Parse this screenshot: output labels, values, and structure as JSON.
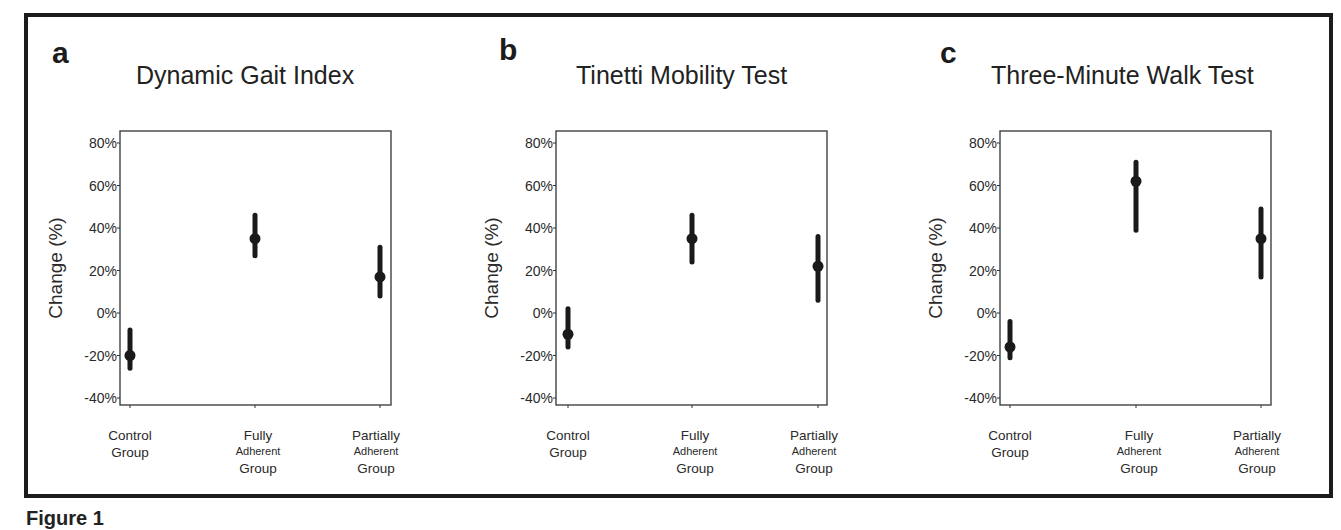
{
  "figure_caption": "Figure 1",
  "y_axis_label": "Change (%)",
  "y_ticks": [
    "80%",
    "60%",
    "40%",
    "20%",
    "0%",
    "-20%",
    "-40%"
  ],
  "categories": [
    {
      "line1": "Control",
      "line2": "Group",
      "line3": ""
    },
    {
      "line1": "Fully",
      "line2": "Adherent",
      "line3": "Group"
    },
    {
      "line1": "Partially",
      "line2": "Adherent",
      "line3": "Group"
    }
  ],
  "panels": [
    {
      "letter": "a",
      "title": "Dynamic Gait Index"
    },
    {
      "letter": "b",
      "title": "Tinetti Mobility Test"
    },
    {
      "letter": "c",
      "title": "Three-Minute Walk Test"
    }
  ],
  "chart_data": [
    {
      "type": "scatter",
      "subtype": "point-with-error-bars",
      "panel": "a",
      "title": "Dynamic Gait Index",
      "xlabel": "",
      "ylabel": "Change (%)",
      "categories": [
        "Control Group",
        "Fully Adherent Group",
        "Partially Adherent Group"
      ],
      "values": [
        -20,
        35,
        17
      ],
      "lower": [
        -26,
        27,
        8
      ],
      "upper": [
        -8,
        46,
        31
      ],
      "yticks": [
        -40,
        -20,
        0,
        20,
        40,
        60,
        80
      ],
      "ylim": [
        -45,
        85
      ],
      "grid": false,
      "legend": null
    },
    {
      "type": "scatter",
      "subtype": "point-with-error-bars",
      "panel": "b",
      "title": "Tinetti Mobility Test",
      "xlabel": "",
      "ylabel": "Change (%)",
      "categories": [
        "Control Group",
        "Fully Adherent Group",
        "Partially Adherent Group"
      ],
      "values": [
        -10,
        35,
        22
      ],
      "lower": [
        -16,
        24,
        6
      ],
      "upper": [
        2,
        46,
        36
      ],
      "yticks": [
        -40,
        -20,
        0,
        20,
        40,
        60,
        80
      ],
      "ylim": [
        -45,
        85
      ],
      "grid": false,
      "legend": null
    },
    {
      "type": "scatter",
      "subtype": "point-with-error-bars",
      "panel": "c",
      "title": "Three-Minute Walk Test",
      "xlabel": "",
      "ylabel": "Change (%)",
      "categories": [
        "Control Group",
        "Fully Adherent Group",
        "Partially Adherent Group"
      ],
      "values": [
        -16,
        62,
        35
      ],
      "lower": [
        -21,
        39,
        17
      ],
      "upper": [
        -4,
        71,
        49
      ],
      "yticks": [
        -40,
        -20,
        0,
        20,
        40,
        60,
        80
      ],
      "ylim": [
        -45,
        85
      ],
      "grid": false,
      "legend": null
    }
  ]
}
